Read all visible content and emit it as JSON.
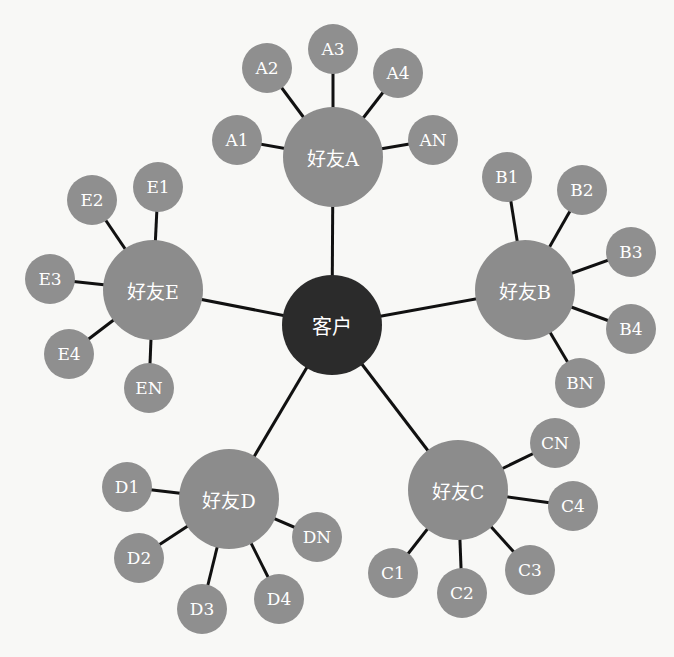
{
  "center": {
    "label": "客户",
    "x": 332,
    "y": 325
  },
  "hubs": [
    {
      "label": "好友A",
      "x": 333,
      "y": 157,
      "leaves": [
        {
          "label": "A1",
          "x": 237,
          "y": 140
        },
        {
          "label": "A2",
          "x": 267,
          "y": 68
        },
        {
          "label": "A3",
          "x": 333,
          "y": 49
        },
        {
          "label": "A4",
          "x": 398,
          "y": 73
        },
        {
          "label": "AN",
          "x": 433,
          "y": 140
        }
      ]
    },
    {
      "label": "好友B",
      "x": 525,
      "y": 290,
      "leaves": [
        {
          "label": "B1",
          "x": 507,
          "y": 177
        },
        {
          "label": "B2",
          "x": 582,
          "y": 190
        },
        {
          "label": "B3",
          "x": 631,
          "y": 252
        },
        {
          "label": "B4",
          "x": 631,
          "y": 329
        },
        {
          "label": "BN",
          "x": 580,
          "y": 383
        }
      ]
    },
    {
      "label": "好友C",
      "x": 458,
      "y": 490,
      "leaves": [
        {
          "label": "C1",
          "x": 393,
          "y": 573
        },
        {
          "label": "C2",
          "x": 462,
          "y": 593
        },
        {
          "label": "C3",
          "x": 530,
          "y": 570
        },
        {
          "label": "C4",
          "x": 573,
          "y": 506
        },
        {
          "label": "CN",
          "x": 555,
          "y": 443
        }
      ]
    },
    {
      "label": "好友D",
      "x": 229,
      "y": 499,
      "leaves": [
        {
          "label": "D1",
          "x": 127,
          "y": 487
        },
        {
          "label": "D2",
          "x": 139,
          "y": 558
        },
        {
          "label": "D3",
          "x": 202,
          "y": 609
        },
        {
          "label": "D4",
          "x": 279,
          "y": 599
        },
        {
          "label": "DN",
          "x": 317,
          "y": 537
        }
      ]
    },
    {
      "label": "好友E",
      "x": 153,
      "y": 290,
      "leaves": [
        {
          "label": "E1",
          "x": 158,
          "y": 187
        },
        {
          "label": "E2",
          "x": 92,
          "y": 200
        },
        {
          "label": "E3",
          "x": 50,
          "y": 279
        },
        {
          "label": "E4",
          "x": 69,
          "y": 354
        },
        {
          "label": "EN",
          "x": 149,
          "y": 388
        }
      ]
    }
  ],
  "colors": {
    "center": "#2b2b2b",
    "hub": "#8c8c8c",
    "leaf": "#8f8f8f",
    "edge": "#111111",
    "text": "#ffffff"
  }
}
